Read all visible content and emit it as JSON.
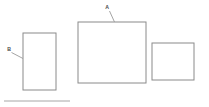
{
  "diagram": {
    "type": "line-drawing",
    "background_color": "#ffffff",
    "stroke_color": "#8a8a8a",
    "leader_color": "#9a9a9a",
    "label_color": "#4a4a4a",
    "canvas": {
      "width": 209,
      "height": 107
    },
    "shapes": [
      {
        "id": "rect-left",
        "name": "left-rectangle",
        "x": 23,
        "y": 33,
        "width": 33,
        "height": 57,
        "fill": "#ffffff",
        "stroke": "#8a8a8a"
      },
      {
        "id": "rect-middle",
        "name": "middle-rectangle",
        "x": 78,
        "y": 22,
        "width": 68,
        "height": 61,
        "fill": "#ffffff",
        "stroke": "#8a8a8a"
      },
      {
        "id": "rect-right",
        "name": "right-rectangle",
        "x": 152,
        "y": 43,
        "width": 42,
        "height": 37,
        "fill": "#ffffff",
        "stroke": "#8a8a8a"
      }
    ],
    "callouts": [
      {
        "id": "callout-a",
        "label": "A",
        "target_shape": "middle-rectangle",
        "text_x": 107,
        "text_y": 9,
        "leader": {
          "x1": 109.5,
          "y1": 11,
          "x2": 114.5,
          "y2": 22
        }
      },
      {
        "id": "callout-b",
        "label": "B",
        "target_shape": "left-rectangle",
        "text_x": 9,
        "text_y": 51,
        "leader": {
          "x1": 11.5,
          "y1": 52.5,
          "x2": 23,
          "y2": 58.5
        }
      }
    ],
    "rules": [
      {
        "id": "baseline-rule",
        "name": "bottom-horizontal-rule",
        "x1": 4,
        "y1": 101,
        "x2": 70,
        "y2": 101,
        "stroke": "#9c9c9c"
      }
    ]
  }
}
